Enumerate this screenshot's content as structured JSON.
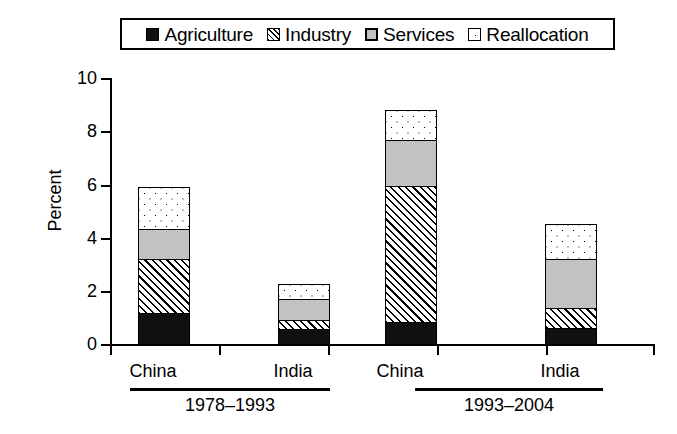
{
  "chart_data": {
    "type": "bar",
    "subtype": "stacked-bar-grouped",
    "title": "",
    "xlabel": "",
    "ylabel": "Percent",
    "ylim": [
      0,
      10
    ],
    "ytick_labels": [
      "0",
      "2",
      "4",
      "6",
      "8",
      "10"
    ],
    "ytick_values": [
      0,
      2,
      4,
      6,
      8,
      10
    ],
    "grid": false,
    "legend_position": "top-center",
    "categories": [
      "China",
      "India",
      "China",
      "India"
    ],
    "groups": [
      {
        "label": "1978–1993",
        "categories": [
          "China",
          "India"
        ]
      },
      {
        "label": "1993–2004",
        "categories": [
          "China",
          "India"
        ]
      }
    ],
    "series": [
      {
        "name": "Agriculture",
        "pattern": "solid-black",
        "values": [
          1.2,
          0.6,
          0.85,
          0.65
        ]
      },
      {
        "name": "Industry",
        "pattern": "diagonal-hatch",
        "values": [
          2.1,
          0.4,
          5.15,
          0.8
        ]
      },
      {
        "name": "Services",
        "pattern": "solid-gray",
        "values": [
          1.15,
          0.85,
          1.8,
          1.9
        ]
      },
      {
        "name": "Reallocation",
        "pattern": "dotted",
        "values": [
          1.65,
          0.6,
          1.2,
          1.35
        ]
      }
    ],
    "totals": [
      6.1,
      2.45,
      9.0,
      4.7
    ],
    "colors": {
      "agriculture": "#101010",
      "industry": "#ffffff",
      "services": "#c2c2c2",
      "reallocation": "#ffffff",
      "outline": "#000000",
      "background": "#ffffff"
    }
  },
  "legend": {
    "items": [
      {
        "label": "Agriculture",
        "swatch": "solid-black-swatch"
      },
      {
        "label": "Industry",
        "swatch": "hatch-swatch"
      },
      {
        "label": "Services",
        "swatch": "gray-swatch"
      },
      {
        "label": "Reallocation",
        "swatch": "dots-swatch"
      }
    ]
  },
  "axes": {
    "y_title": "Percent",
    "y_ticks": [
      "10",
      "8",
      "6",
      "4",
      "2",
      "0"
    ]
  },
  "x_labels": {
    "bar_labels": [
      "China",
      "India",
      "China",
      "India"
    ],
    "group_labels": [
      "1978–1993",
      "1993–2004"
    ]
  }
}
